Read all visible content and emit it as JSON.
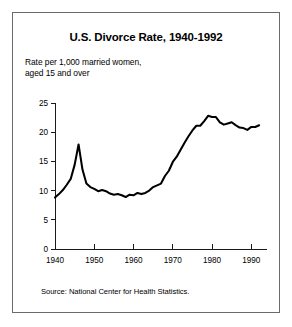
{
  "figure": {
    "title": "U.S. Divorce Rate, 1940-1992",
    "subtitle": "Rate per 1,000 married women,\naged 15 and over",
    "source": "Source: National Center for Health Statistics.",
    "border_color": "#6b6b6b",
    "background": "#ffffff"
  },
  "chart_data": {
    "type": "line",
    "title": "U.S. Divorce Rate, 1940-1992",
    "subtitle": "Rate per 1,000 married women, aged 15 and over",
    "xlabel": "",
    "ylabel": "Rate per 1,000 married women, aged 15 and over",
    "xlim": [
      1940,
      1994
    ],
    "ylim": [
      0,
      25
    ],
    "xticks": [
      1940,
      1950,
      1960,
      1970,
      1980,
      1990
    ],
    "yticks": [
      0,
      5,
      10,
      15,
      20,
      25
    ],
    "grid": false,
    "legend": null,
    "line_color": "#000000",
    "series": [
      {
        "name": "Divorce rate per 1,000 married women aged 15+",
        "x": [
          1940,
          1941,
          1942,
          1943,
          1944,
          1945,
          1946,
          1947,
          1948,
          1949,
          1950,
          1951,
          1952,
          1953,
          1954,
          1955,
          1956,
          1957,
          1958,
          1959,
          1960,
          1961,
          1962,
          1963,
          1964,
          1965,
          1966,
          1967,
          1968,
          1969,
          1970,
          1971,
          1972,
          1973,
          1974,
          1975,
          1976,
          1977,
          1978,
          1979,
          1980,
          1981,
          1982,
          1983,
          1984,
          1985,
          1986,
          1987,
          1988,
          1989,
          1990,
          1991,
          1992
        ],
        "values": [
          8.8,
          9.4,
          10.1,
          11.0,
          12.0,
          14.4,
          17.9,
          13.6,
          11.2,
          10.6,
          10.3,
          9.9,
          10.1,
          9.9,
          9.5,
          9.3,
          9.4,
          9.2,
          8.9,
          9.3,
          9.2,
          9.6,
          9.4,
          9.6,
          10.0,
          10.6,
          10.9,
          11.2,
          12.5,
          13.4,
          14.9,
          15.8,
          17.0,
          18.2,
          19.3,
          20.3,
          21.1,
          21.1,
          21.9,
          22.8,
          22.6,
          22.6,
          21.7,
          21.3,
          21.5,
          21.7,
          21.2,
          20.8,
          20.7,
          20.4,
          20.9,
          20.9,
          21.2
        ]
      }
    ],
    "annotations": [
      {
        "label": "post-WWII peak",
        "x": 1946,
        "y": 17.9
      },
      {
        "label": "low point",
        "x": 1958,
        "y": 8.9
      },
      {
        "label": "all-time high",
        "x": 1979,
        "y": 22.8
      }
    ]
  },
  "axis": {
    "y_tick_labels": [
      "0",
      "5",
      "10",
      "15",
      "20",
      "25"
    ],
    "x_tick_labels": [
      "1940",
      "1950",
      "1960",
      "1970",
      "1980",
      "1990"
    ]
  }
}
